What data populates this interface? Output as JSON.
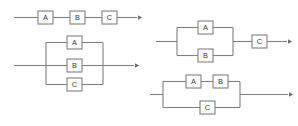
{
  "figure": {
    "type": "block-diagram",
    "kind": "reliability-block-diagrams",
    "background_color": "#ffffff",
    "line_color": "#808080",
    "label_color": "#3a3a3a",
    "width": 298,
    "height": 126
  },
  "diagrams": [
    {
      "id": "series-abc",
      "name": "series",
      "description": "Three blocks A, B, C connected in series",
      "blocks": [
        {
          "label": "A",
          "x": 38,
          "y": 11,
          "w": 15,
          "h": 13
        },
        {
          "label": "B",
          "x": 70,
          "y": 11,
          "w": 15,
          "h": 13
        },
        {
          "label": "C",
          "x": 102,
          "y": 11,
          "w": 15,
          "h": 13
        }
      ],
      "input_line": {
        "x1": 14,
        "y1": 17.5,
        "x2": 38,
        "y2": 17.5
      },
      "links": [
        {
          "x1": 53,
          "y1": 17.5,
          "x2": 70,
          "y2": 17.5
        },
        {
          "x1": 85,
          "y1": 17.5,
          "x2": 102,
          "y2": 17.5
        }
      ],
      "output_line": {
        "x1": 117,
        "y1": 17.5,
        "x2": 137,
        "y2": 17.5
      },
      "arrow": {
        "x": 141,
        "y": 17.5
      }
    },
    {
      "id": "parallel-abc",
      "name": "parallel",
      "description": "Three blocks A, B, C connected in parallel across two rails",
      "blocks": [
        {
          "label": "A",
          "x": 67,
          "y": 36,
          "w": 15,
          "h": 13
        },
        {
          "label": "B",
          "x": 67,
          "y": 59,
          "w": 15,
          "h": 13
        },
        {
          "label": "C",
          "x": 67,
          "y": 78,
          "w": 15,
          "h": 13
        }
      ],
      "rail_left_x": 46,
      "rail_right_x": 103,
      "rail_top_y": 42.5,
      "rail_bottom_y": 84.5,
      "branch_ys": [
        42.5,
        65.5,
        84.5
      ],
      "input_line": {
        "x1": 14,
        "y1": 65.5,
        "x2": 46,
        "y2": 65.5
      },
      "output_line": {
        "x1": 103,
        "y1": 65.5,
        "x2": 134,
        "y2": 65.5
      },
      "arrow": {
        "x": 138,
        "y": 65.5
      }
    },
    {
      "id": "parallel-ab-series-c",
      "name": "parallel-then-series",
      "description": "Blocks A and B in parallel, followed by block C in series",
      "blocks": [
        {
          "label": "A",
          "x": 198,
          "y": 21,
          "w": 15,
          "h": 13
        },
        {
          "label": "B",
          "x": 198,
          "y": 49,
          "w": 15,
          "h": 13
        },
        {
          "label": "C",
          "x": 252,
          "y": 35,
          "w": 15,
          "h": 13
        }
      ],
      "rail_left_x": 177,
      "rail_right_x": 233,
      "rail_top_y": 27.5,
      "rail_bottom_y": 55.5,
      "branch_ys": [
        27.5,
        55.5
      ],
      "mid_y": 41.5,
      "input_line": {
        "x1": 156,
        "y1": 41.5,
        "x2": 177,
        "y2": 41.5
      },
      "link_line": {
        "x1": 233,
        "y1": 41.5,
        "x2": 252,
        "y2": 41.5
      },
      "output_line": {
        "x1": 267,
        "y1": 41.5,
        "x2": 287,
        "y2": 41.5
      },
      "arrow": {
        "x": 291,
        "y": 41.5
      }
    },
    {
      "id": "series-ab-parallel-c",
      "name": "series-then-parallel",
      "description": "Blocks A and B in series on the upper branch, in parallel with block C on the lower branch",
      "blocks": [
        {
          "label": "A",
          "x": 186,
          "y": 75,
          "w": 15,
          "h": 13
        },
        {
          "label": "B",
          "x": 213,
          "y": 75,
          "w": 15,
          "h": 13
        },
        {
          "label": "C",
          "x": 200,
          "y": 101,
          "w": 15,
          "h": 13
        }
      ],
      "rail_left_x": 163,
      "rail_right_x": 240,
      "rail_top_y": 81.5,
      "rail_bottom_y": 107.5,
      "branch_ys": [
        81.5,
        107.5
      ],
      "mid_y": 94.5,
      "series_link": {
        "x1": 201,
        "y1": 81.5,
        "x2": 213,
        "y2": 81.5
      },
      "input_line": {
        "x1": 150,
        "y1": 94.5,
        "x2": 163,
        "y2": 94.5
      },
      "output_line": {
        "x1": 240,
        "y1": 94.5,
        "x2": 288,
        "y2": 94.5
      },
      "arrow": {
        "x": 292,
        "y": 94.5
      }
    }
  ]
}
